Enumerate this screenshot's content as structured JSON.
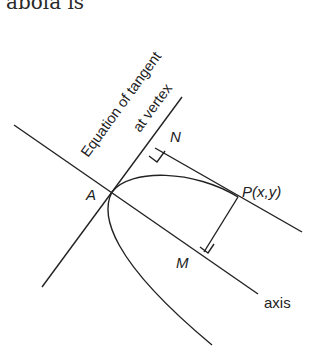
{
  "header": {
    "partial_text": "abola is"
  },
  "diagram": {
    "title_lines": [
      "Equation of tangent",
      "at vertex"
    ],
    "points": {
      "A": "A",
      "N": "N",
      "P": "P(x,y)",
      "M": "M"
    },
    "axis_label": "axis",
    "right_angle_markers": [
      "at N",
      "at M"
    ],
    "stroke_color": "#222222",
    "background_color": "#ffffff"
  }
}
